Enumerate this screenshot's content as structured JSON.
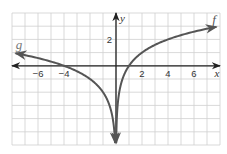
{
  "chart_data": {
    "type": "line",
    "title": "",
    "xlabel": "x",
    "ylabel": "y",
    "xlim": [
      -8,
      8
    ],
    "ylim": [
      -6,
      4
    ],
    "grid": true,
    "grid_step": 1,
    "x_ticks": [
      {
        "value": -6,
        "label": "−6"
      },
      {
        "value": -4,
        "label": "−4"
      },
      {
        "value": 2,
        "label": "2"
      },
      {
        "value": 4,
        "label": "4"
      },
      {
        "value": 6,
        "label": "6"
      }
    ],
    "y_ticks": [
      {
        "value": 2,
        "label": "2"
      }
    ],
    "series": [
      {
        "name": "f",
        "label": "f",
        "domain": "x > 0",
        "approx_rule": "log2(x)",
        "points": [
          [
            0.016,
            -6
          ],
          [
            0.0625,
            -4
          ],
          [
            0.25,
            -2
          ],
          [
            0.5,
            -1
          ],
          [
            1,
            0
          ],
          [
            2,
            1
          ],
          [
            4,
            2
          ],
          [
            8,
            3
          ]
        ],
        "arrow_ends": [
          "bottom",
          "right"
        ],
        "color": "#555555"
      },
      {
        "name": "g",
        "label": "g",
        "domain": "x < 0",
        "approx_rule": "log2(-x) - 2",
        "points": [
          [
            -8,
            1
          ],
          [
            -6,
            0.58
          ],
          [
            -4,
            0
          ],
          [
            -2,
            -1
          ],
          [
            -1,
            -2
          ],
          [
            -0.5,
            -3
          ],
          [
            -0.25,
            -4
          ],
          [
            -0.0625,
            -6
          ]
        ],
        "arrow_ends": [
          "left",
          "bottom"
        ],
        "color": "#555555"
      }
    ],
    "legend": "inline labels at curve ends (f top-right, g top-left)"
  },
  "colors": {
    "grid": "#cfcfcf",
    "axes": "#222222",
    "curves": "#555555",
    "labels": "#333333"
  }
}
